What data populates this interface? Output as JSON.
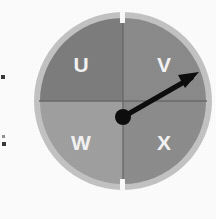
{
  "figure": {
    "kind": "spinner-wheel-diagram",
    "sector_count": 4,
    "labels": [
      "U",
      "V",
      "W",
      "X"
    ],
    "sectors": [
      {
        "label": "U",
        "position": "upper-left",
        "start_deg": 180,
        "end_deg": 270,
        "color": "#7d7d7d"
      },
      {
        "label": "V",
        "position": "upper-right",
        "start_deg": 270,
        "end_deg": 360,
        "color": "#8b8b8b"
      },
      {
        "label": "W",
        "position": "lower-left",
        "start_deg": 90,
        "end_deg": 180,
        "color": "#a0a0a0"
      },
      {
        "label": "X",
        "position": "lower-right",
        "start_deg": 0,
        "end_deg": 90,
        "color": "#8d8d8d"
      }
    ],
    "rim_color": "#c3c3c3",
    "divider_color": "#6a6a6a",
    "gap_marker_color": "#fbfbfb",
    "gap_markers": [
      "top",
      "bottom"
    ],
    "pointer": {
      "color": "#0d0d0d",
      "points_to": "V",
      "pivot": {
        "x": 90,
        "y": 106
      },
      "tip": {
        "x": 163,
        "y": 64
      }
    },
    "background_color": "#fdfdfd"
  },
  "margin_marks": {
    "upper": "•",
    "lower": "•"
  }
}
